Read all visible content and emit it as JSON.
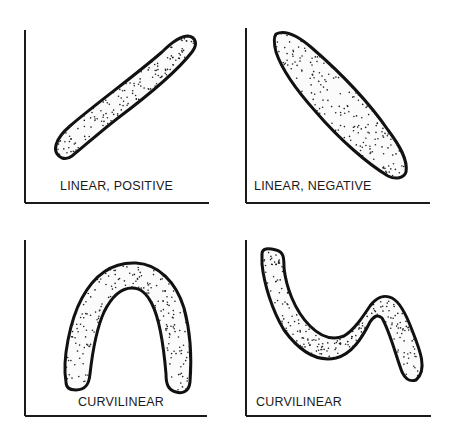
{
  "panels": [
    {
      "id": "linear-positive",
      "label": "LINEAR, POSITIVE",
      "relationship": "linear",
      "direction": "positive"
    },
    {
      "id": "linear-negative",
      "label": "LINEAR, NEGATIVE",
      "relationship": "linear",
      "direction": "negative"
    },
    {
      "id": "curvilinear-inverted-u",
      "label": "CURVILINEAR",
      "relationship": "curvilinear",
      "shape": "inverted U"
    },
    {
      "id": "curvilinear-wave",
      "label": "CURVILINEAR",
      "relationship": "curvilinear",
      "shape": "down-up-down wave"
    }
  ],
  "colors": {
    "ink": "#111111",
    "background": "#ffffff"
  }
}
